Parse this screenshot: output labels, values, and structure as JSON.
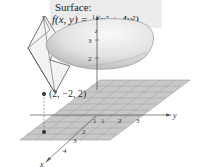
{
  "caption": {
    "title": "Surface:",
    "equation_lhs": "f(x, y) = ",
    "fraction_num": "1",
    "fraction_den": "10",
    "equation_rhs": "(x² + 4y²)"
  },
  "axes": {
    "x_label": "x",
    "y_label": "y",
    "z_label": "z"
  },
  "ticks": {
    "z": [
      "2",
      "3"
    ],
    "y": [
      "1",
      "2",
      "3"
    ],
    "x": [
      "1",
      "2",
      "3",
      "4"
    ]
  },
  "point": {
    "label": "(2, −2, 2)"
  },
  "colors": {
    "grid_fill": "#c8c8c8",
    "grid_line": "#9a9a9a",
    "surface_light": "#f4f4f4",
    "surface_dark": "#bdbdbd",
    "caption_bg": "#ececec"
  }
}
